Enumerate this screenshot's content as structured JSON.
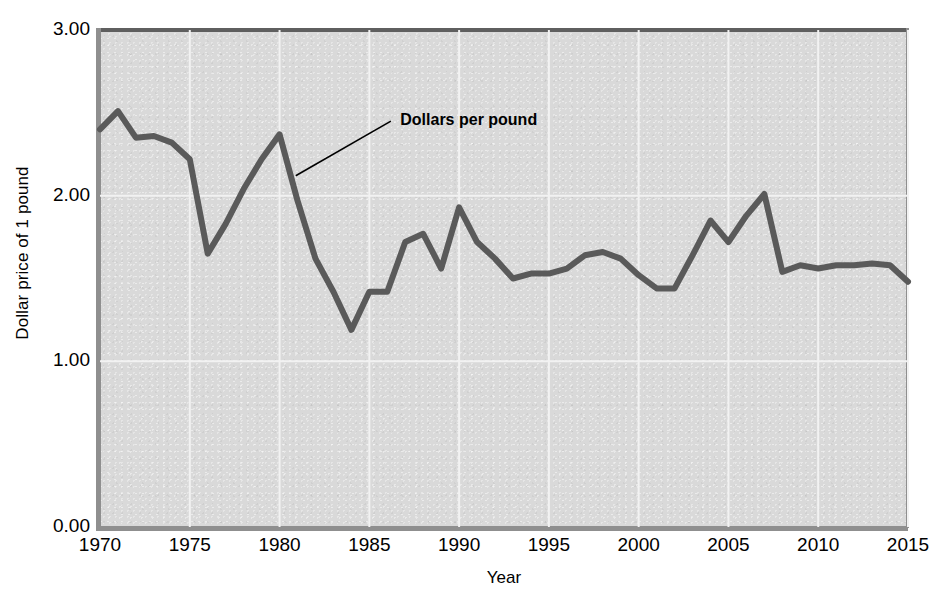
{
  "chart_data": {
    "type": "line",
    "title": "",
    "xlabel": "Year",
    "ylabel": "Dollar price of 1 pound",
    "xlim": [
      1970,
      2015
    ],
    "ylim": [
      0.0,
      3.0
    ],
    "xticks": [
      "1970",
      "1975",
      "1980",
      "1985",
      "1990",
      "1995",
      "2000",
      "2005",
      "2010",
      "2015"
    ],
    "yticks": [
      "0.00",
      "1.00",
      "2.00",
      "3.00"
    ],
    "grid": true,
    "legend_position": "inline-annotation",
    "annotations": [
      {
        "text": "Dollars per pound",
        "x": 1986.5,
        "y": 2.45
      }
    ],
    "series": [
      {
        "name": "Dollars per pound",
        "color": "#5a5a5a",
        "x": [
          1970,
          1971,
          1972,
          1973,
          1974,
          1975,
          1976,
          1977,
          1978,
          1979,
          1980,
          1981,
          1982,
          1983,
          1984,
          1985,
          1986,
          1987,
          1988,
          1989,
          1990,
          1991,
          1992,
          1993,
          1994,
          1995,
          1996,
          1997,
          1998,
          1999,
          2000,
          2001,
          2002,
          2003,
          2004,
          2005,
          2006,
          2007,
          2008,
          2009,
          2010,
          2011,
          2012,
          2013,
          2014,
          2015
        ],
        "values": [
          2.4,
          2.51,
          2.35,
          2.36,
          2.32,
          2.22,
          1.65,
          1.83,
          2.04,
          2.22,
          2.37,
          1.97,
          1.62,
          1.42,
          1.19,
          1.42,
          1.42,
          1.72,
          1.77,
          1.56,
          1.93,
          1.72,
          1.62,
          1.5,
          1.53,
          1.53,
          1.56,
          1.64,
          1.66,
          1.62,
          1.52,
          1.44,
          1.44,
          1.64,
          1.85,
          1.72,
          1.88,
          2.01,
          1.54,
          1.58,
          1.56,
          1.58,
          1.58,
          1.59,
          1.58,
          1.48
        ]
      }
    ]
  },
  "figure": {
    "background_color": "#d9d9d9",
    "line_color": "#5a5a5a",
    "axis_color": "#8f8f8f",
    "gridline_color": "#f2f2f2",
    "text_color": "#000000"
  }
}
